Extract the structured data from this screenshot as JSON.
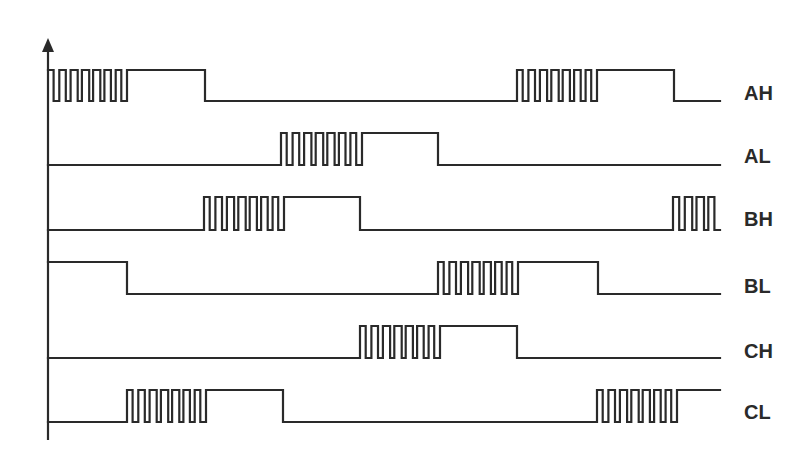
{
  "diagram": {
    "type": "timing-diagram",
    "colors": {
      "stroke": "#2a2a2a",
      "background": "#ffffff"
    },
    "axis": {
      "x": 48,
      "top": 38,
      "bottom": 440
    },
    "pwm_period": 11,
    "signals": [
      {
        "name": "AH",
        "high_y": 70,
        "low_y": 101,
        "label_y": 93,
        "segments": [
          [
            "pwm",
            48,
            127
          ],
          [
            "high",
            127,
            205
          ],
          [
            "low",
            205,
            517
          ],
          [
            "pwm",
            517,
            597
          ],
          [
            "high",
            597,
            674
          ],
          [
            "low",
            674,
            720
          ]
        ]
      },
      {
        "name": "AL",
        "high_y": 133,
        "low_y": 165,
        "label_y": 156,
        "segments": [
          [
            "low",
            48,
            281
          ],
          [
            "pwm",
            281,
            362
          ],
          [
            "high",
            362,
            438
          ],
          [
            "low",
            438,
            720
          ]
        ]
      },
      {
        "name": "BH",
        "high_y": 197,
        "low_y": 230,
        "label_y": 219,
        "segments": [
          [
            "low",
            48,
            204
          ],
          [
            "pwm",
            204,
            284
          ],
          [
            "high",
            284,
            360
          ],
          [
            "low",
            360,
            673
          ],
          [
            "pwm",
            673,
            720
          ]
        ]
      },
      {
        "name": "BL",
        "high_y": 262,
        "low_y": 294,
        "label_y": 286,
        "segments": [
          [
            "high",
            48,
            127
          ],
          [
            "low",
            127,
            438
          ],
          [
            "pwm",
            438,
            518
          ],
          [
            "high",
            518,
            598
          ],
          [
            "low",
            598,
            720
          ]
        ]
      },
      {
        "name": "CH",
        "high_y": 326,
        "low_y": 358,
        "label_y": 351,
        "segments": [
          [
            "low",
            48,
            360
          ],
          [
            "pwm",
            360,
            440
          ],
          [
            "high",
            440,
            517
          ],
          [
            "low",
            517,
            720
          ]
        ]
      },
      {
        "name": "CL",
        "high_y": 390,
        "low_y": 422,
        "label_y": 412,
        "segments": [
          [
            "low",
            48,
            127
          ],
          [
            "pwm",
            127,
            206
          ],
          [
            "high",
            206,
            283
          ],
          [
            "low",
            283,
            597
          ],
          [
            "pwm",
            597,
            677
          ],
          [
            "high",
            677,
            720
          ]
        ]
      }
    ]
  }
}
